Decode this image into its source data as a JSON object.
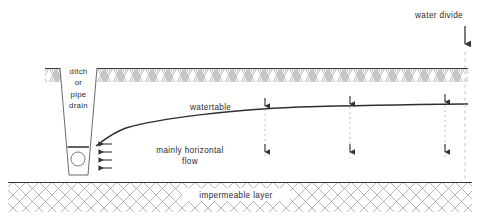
{
  "figure": {
    "kind": "cross-section-diagram",
    "background_color": "#ffffff",
    "line_color": "#3a3a3a",
    "hatch_color": "#9a9a9a",
    "text_color": "#2b2b2b",
    "width": 480,
    "height": 219
  },
  "labels": {
    "water_divide": "water divide",
    "ditch_line1": "ditch",
    "ditch_line2": "or",
    "ditch_line3": "pipe",
    "ditch_line4": "drain",
    "watertable": "watertable",
    "flow_line1": "mainly horizontal",
    "flow_line2": "flow",
    "impermeable": "impermeable layer"
  },
  "layers": {
    "topsoil": {
      "name": "topsoil",
      "hatch": "chevron",
      "top_y": 68,
      "bottom_y": 82,
      "left_x": 45,
      "right_x": 468
    },
    "aquifer": {
      "name": "permeable aquifer",
      "top_y": 82,
      "bottom_y": 182
    },
    "impermeable": {
      "name": "impermeable layer",
      "hatch": "cross",
      "top_y": 182,
      "bottom_y": 212,
      "left_x": 8,
      "right_x": 472
    }
  },
  "ditch": {
    "top_left_x": 60,
    "top_right_x": 97,
    "top_y": 68,
    "bottom_left_x": 69,
    "bottom_right_x": 88,
    "bottom_y": 175,
    "water_level_y": 147,
    "pipe_center_x": 78,
    "pipe_center_y": 159,
    "pipe_radius": 7
  },
  "watertable": {
    "start_x": 96,
    "start_y": 146,
    "end_x": 468,
    "end_y": 104,
    "note": "steeply rising near the drain then nearly flat towards the water divide"
  },
  "horizontal_flow_arrows": {
    "count": 4,
    "direction": "left",
    "x_tail": 112,
    "x_head": 95,
    "y_values": [
      144,
      152,
      160,
      168
    ]
  },
  "percolation_markers": {
    "direction": "down",
    "note": "dotted vertical lines crossing the watertable, each with an arrowhead above and below",
    "x_values": [
      265,
      350,
      445
    ],
    "top_y": 97,
    "bottom_y": 160
  },
  "water_divide_marker": {
    "x": 465,
    "arrow_top_y": 28,
    "arrow_bottom_y": 48,
    "dash_top_y": 52,
    "dash_bottom_y": 212
  }
}
